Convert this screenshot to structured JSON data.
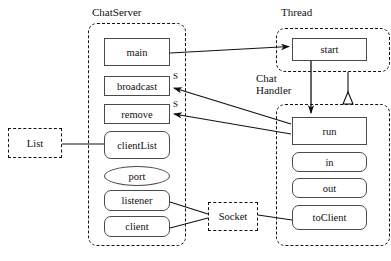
{
  "diagram": {
    "title_type": "uml-class-collaboration-diagram",
    "background": "#ffffff",
    "line_color": "#111111",
    "box_border_color": "#4a4a4a"
  },
  "packages": [
    {
      "id": "chatserver",
      "label": "ChatServer"
    },
    {
      "id": "thread",
      "label": "Thread"
    },
    {
      "id": "chathandler",
      "label": "Chat\nHandler",
      "label_line1": "Chat",
      "label_line2": "Handler"
    }
  ],
  "chatserver": {
    "label": "ChatServer",
    "members": [
      {
        "name": "main",
        "shape": "square"
      },
      {
        "name": "broadcast",
        "shape": "square",
        "stereotype": "S"
      },
      {
        "name": "remove",
        "shape": "square",
        "stereotype": "S"
      },
      {
        "name": "clientList",
        "shape": "rounded"
      },
      {
        "name": "port",
        "shape": "ellipse"
      },
      {
        "name": "listener",
        "shape": "rounded"
      },
      {
        "name": "client",
        "shape": "rounded"
      }
    ]
  },
  "thread": {
    "label": "Thread",
    "members": [
      {
        "name": "start",
        "shape": "square"
      }
    ]
  },
  "chathandler": {
    "label_line1": "Chat",
    "label_line2": "Handler",
    "members": [
      {
        "name": "run",
        "shape": "square"
      },
      {
        "name": "in",
        "shape": "rounded"
      },
      {
        "name": "out",
        "shape": "rounded"
      },
      {
        "name": "toClient",
        "shape": "rounded"
      }
    ]
  },
  "external_nodes": [
    {
      "id": "list",
      "label": "List"
    },
    {
      "id": "socket",
      "label": "Socket"
    }
  ],
  "edges": [
    {
      "id": "main-to-start",
      "from": "main",
      "to": "start",
      "arrow": "filled"
    },
    {
      "id": "run-to-broadcast",
      "from": "run",
      "to": "broadcast",
      "arrow": "filled",
      "label": "S"
    },
    {
      "id": "run-to-remove",
      "from": "run",
      "to": "remove",
      "arrow": "filled",
      "label": "S"
    },
    {
      "id": "start-to-run",
      "from": "start",
      "to": "run",
      "arrow": "filled"
    },
    {
      "id": "chathandler-to-thread",
      "from": "ChatHandler",
      "to": "Thread",
      "arrow": "inheritance-open-triangle"
    },
    {
      "id": "list-to-clientList",
      "from": "List",
      "to": "clientList",
      "arrow": "none"
    },
    {
      "id": "listener-to-socket",
      "from": "listener",
      "to": "Socket",
      "arrow": "none"
    },
    {
      "id": "client-to-socket",
      "from": "client",
      "to": "Socket",
      "arrow": "none"
    },
    {
      "id": "socket-to-toClient",
      "from": "Socket",
      "to": "toClient",
      "arrow": "none"
    }
  ]
}
